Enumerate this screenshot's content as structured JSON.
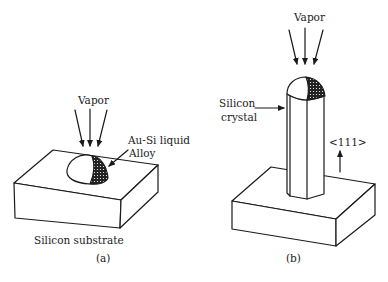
{
  "figure": {
    "panel_a": {
      "vapor_label": "Vapor",
      "droplet_label_line1": "Au-Si liquid",
      "droplet_label_line2": "Alloy",
      "substrate_label": "Silicon substrate",
      "caption": "(a)"
    },
    "panel_b": {
      "vapor_label": "Vapor",
      "crystal_label_line1": "Silicon",
      "crystal_label_line2": "crystal",
      "direction_label": "<111>",
      "caption": "(b)"
    },
    "colors": {
      "line": "#1a1a1a",
      "alloy_fill": "#2a2a2a",
      "background": "#ffffff"
    }
  }
}
